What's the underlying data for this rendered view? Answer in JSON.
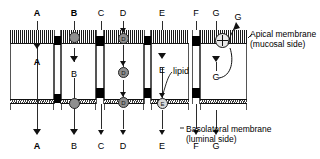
{
  "diagram": {
    "membranes": {
      "apical_label_line1": "Apical membrane",
      "apical_label_line2": "(mucosal side)",
      "basolateral_label_line1": "Basolateral membrane",
      "basolateral_label_line2": "(luminal side)"
    },
    "annotations": {
      "lipid": "lipid"
    },
    "top_labels": [
      {
        "id": "A",
        "text": "A",
        "x": 37,
        "bold": true
      },
      {
        "id": "B",
        "text": "B",
        "x": 74,
        "bold": true
      },
      {
        "id": "C",
        "text": "C",
        "x": 101,
        "bold": false
      },
      {
        "id": "D",
        "text": "D",
        "x": 123,
        "bold": false
      },
      {
        "id": "E",
        "text": "E",
        "x": 162,
        "bold": false
      },
      {
        "id": "F",
        "text": "F",
        "x": 196,
        "bold": false
      },
      {
        "id": "G",
        "text": "G",
        "x": 216,
        "bold": false
      },
      {
        "id": "G2",
        "text": "G",
        "x": 238,
        "bold": false
      }
    ],
    "mid_labels": [
      {
        "id": "A",
        "text": "A",
        "x": 37,
        "bold": true
      },
      {
        "id": "B",
        "text": "B",
        "x": 74,
        "bold": false
      },
      {
        "id": "E",
        "text": "E",
        "x": 162,
        "bold": false
      },
      {
        "id": "Gmid",
        "text": "G",
        "x": 216,
        "bold": false
      }
    ],
    "bottom_labels": [
      {
        "id": "A",
        "text": "A",
        "x": 37,
        "bold": true
      },
      {
        "id": "B",
        "text": "B",
        "x": 74,
        "bold": false
      },
      {
        "id": "C",
        "text": "C",
        "x": 101,
        "bold": false
      },
      {
        "id": "D",
        "text": "D",
        "x": 123,
        "bold": false
      },
      {
        "id": "E",
        "text": "E",
        "x": 162,
        "bold": false
      },
      {
        "id": "F",
        "text": "F",
        "x": 196,
        "bold": false
      },
      {
        "id": "G",
        "text": "G",
        "x": 216,
        "bold": false
      }
    ],
    "carriers": [
      {
        "id": "B-apical",
        "label": "",
        "x": 74,
        "y": 37,
        "size": 11,
        "filled": true
      },
      {
        "id": "B-basal",
        "label": "",
        "x": 74,
        "y": 103,
        "size": 11,
        "filled": true
      },
      {
        "id": "D-apical",
        "label": "D",
        "x": 123,
        "y": 37,
        "size": 11,
        "filled": true
      },
      {
        "id": "D-middle",
        "label": "D",
        "x": 123,
        "y": 72,
        "size": 10,
        "filled": true
      },
      {
        "id": "D-basal",
        "label": "D",
        "x": 123,
        "y": 103,
        "size": 11,
        "filled": true
      },
      {
        "id": "E-basal",
        "label": "E",
        "x": 162,
        "y": 103,
        "size": 10,
        "filled": false
      }
    ],
    "pinwheel": {
      "id": "G-apical",
      "x": 222,
      "y": 40,
      "size": 15
    },
    "colors": {
      "ink": "#111111",
      "carrier_fill": "#8f8f8f",
      "carrier_open": "#d9d9d9",
      "membrane": "#1a1a1a",
      "background": "#ffffff"
    }
  }
}
